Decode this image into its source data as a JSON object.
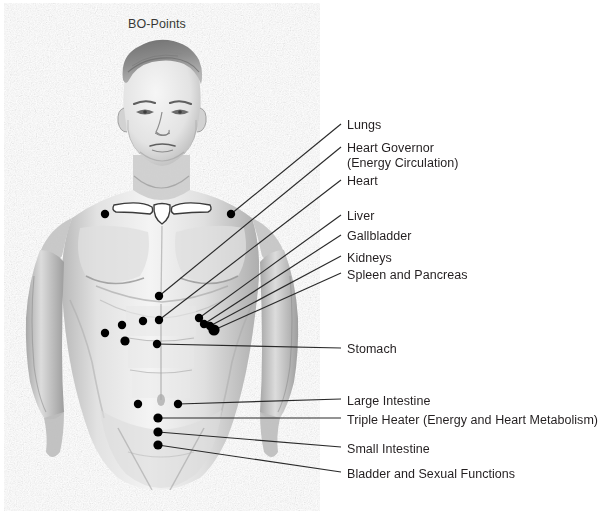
{
  "title": "BO-Points",
  "colors": {
    "text": "#231f20",
    "leader_line": "#2a2a2a",
    "point_marker": "#000000",
    "background": "#ffffff",
    "sketch_dark": "#5d5d5d",
    "sketch_mid": "#9a9a9a",
    "sketch_light": "#c8c8c8"
  },
  "figure": {
    "width": 614,
    "height": 511
  },
  "labels": [
    {
      "id": "lungs",
      "text": "Lungs",
      "x": 347,
      "y": 118
    },
    {
      "id": "heart-gov",
      "text": "Heart Governor",
      "x": 347,
      "y": 141
    },
    {
      "id": "heart-gov2",
      "text": "(Energy Circulation)",
      "x": 347,
      "y": 156
    },
    {
      "id": "heart",
      "text": "Heart",
      "x": 347,
      "y": 174
    },
    {
      "id": "liver",
      "text": "Liver",
      "x": 347,
      "y": 209
    },
    {
      "id": "gallbladder",
      "text": "Gallbladder",
      "x": 347,
      "y": 229
    },
    {
      "id": "kidneys",
      "text": "Kidneys",
      "x": 347,
      "y": 251
    },
    {
      "id": "spleen",
      "text": "Spleen and Pancreas",
      "x": 347,
      "y": 268
    },
    {
      "id": "stomach",
      "text": "Stomach",
      "x": 347,
      "y": 342
    },
    {
      "id": "large-int",
      "text": "Large Intestine",
      "x": 347,
      "y": 394
    },
    {
      "id": "triple",
      "text": "Triple Heater (Energy and Heart Metabolism)",
      "x": 347,
      "y": 413
    },
    {
      "id": "small-int",
      "text": "Small Intestine",
      "x": 347,
      "y": 442
    },
    {
      "id": "bladder",
      "text": "Bladder and Sexual Functions",
      "x": 347,
      "y": 467
    }
  ],
  "leaders": [
    {
      "id": "lungs",
      "x1": 231,
      "y1": 214,
      "x2": 341,
      "y2": 124
    },
    {
      "id": "heart-gov",
      "x1": 159,
      "y1": 296,
      "x2": 341,
      "y2": 147
    },
    {
      "id": "heart",
      "x1": 159,
      "y1": 320,
      "x2": 341,
      "y2": 180
    },
    {
      "id": "liver",
      "x1": 199,
      "y1": 318,
      "x2": 341,
      "y2": 215
    },
    {
      "id": "gallbladder",
      "x1": 204,
      "y1": 324,
      "x2": 341,
      "y2": 235
    },
    {
      "id": "kidneys",
      "x1": 210,
      "y1": 326,
      "x2": 341,
      "y2": 256
    },
    {
      "id": "spleen",
      "x1": 214,
      "y1": 330,
      "x2": 341,
      "y2": 273
    },
    {
      "id": "stomach",
      "x1": 157,
      "y1": 344,
      "x2": 341,
      "y2": 348
    },
    {
      "id": "large-int",
      "x1": 178,
      "y1": 404,
      "x2": 341,
      "y2": 399
    },
    {
      "id": "triple",
      "x1": 158,
      "y1": 418,
      "x2": 341,
      "y2": 418
    },
    {
      "id": "small-int",
      "x1": 158,
      "y1": 432,
      "x2": 341,
      "y2": 447
    },
    {
      "id": "bladder",
      "x1": 158,
      "y1": 445,
      "x2": 341,
      "y2": 472
    }
  ],
  "points": [
    {
      "id": "pt-lung-left",
      "x": 105,
      "y": 214,
      "r": 4.2,
      "labelled": false
    },
    {
      "id": "pt-lung-right",
      "x": 231,
      "y": 214,
      "r": 4.2,
      "labelled": true
    },
    {
      "id": "pt-heart-gov",
      "x": 159,
      "y": 296,
      "r": 4.2,
      "labelled": true
    },
    {
      "id": "pt-heart",
      "x": 159,
      "y": 320,
      "r": 4.2,
      "labelled": true
    },
    {
      "id": "pt-liver",
      "x": 199,
      "y": 318,
      "r": 4.2,
      "labelled": true
    },
    {
      "id": "pt-gallbladder",
      "x": 204,
      "y": 324,
      "r": 4.2,
      "labelled": true
    },
    {
      "id": "pt-kidneys",
      "x": 210,
      "y": 326,
      "r": 4.2,
      "labelled": true
    },
    {
      "id": "pt-spleen",
      "x": 214,
      "y": 330,
      "r": 5.6,
      "labelled": true
    },
    {
      "id": "pt-flank-a",
      "x": 122,
      "y": 325,
      "r": 4.2,
      "labelled": false
    },
    {
      "id": "pt-flank-b",
      "x": 143,
      "y": 321,
      "r": 4.2,
      "labelled": false
    },
    {
      "id": "pt-flank-c",
      "x": 105,
      "y": 333,
      "r": 4.2,
      "labelled": false
    },
    {
      "id": "pt-flank-d",
      "x": 125,
      "y": 341,
      "r": 4.6,
      "labelled": false
    },
    {
      "id": "pt-stomach",
      "x": 157,
      "y": 344,
      "r": 4.2,
      "labelled": true
    },
    {
      "id": "pt-large-int",
      "x": 178,
      "y": 404,
      "r": 4.2,
      "labelled": true
    },
    {
      "id": "pt-umbilical",
      "x": 138,
      "y": 404,
      "r": 4.2,
      "labelled": false
    },
    {
      "id": "pt-triple",
      "x": 158,
      "y": 418,
      "r": 4.6,
      "labelled": true
    },
    {
      "id": "pt-small-int",
      "x": 158,
      "y": 432,
      "r": 4.6,
      "labelled": true
    },
    {
      "id": "pt-bladder",
      "x": 158,
      "y": 445,
      "r": 4.6,
      "labelled": true
    }
  ]
}
